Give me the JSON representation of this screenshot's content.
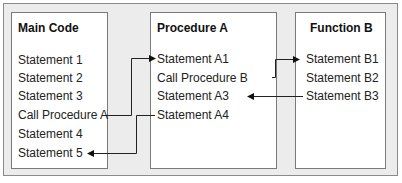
{
  "boxes": [
    {
      "title": "Main Code",
      "statements": [
        "Statement 1",
        "Statement 2",
        "Statement 3",
        "Call Procedure A",
        "Statement 4",
        "Statement 5"
      ]
    },
    {
      "title": "Procedure A",
      "statements": [
        "Statement A1",
        "Call Procedure B",
        "Statement A3",
        "Statement A4"
      ]
    },
    {
      "title": "Function B",
      "statements": [
        "Statement B1",
        "Statement B2",
        "Statement B3"
      ]
    }
  ],
  "connections": [
    {
      "from": "Call Procedure A",
      "to": "Statement A1"
    },
    {
      "from": "Call Procedure B",
      "to": "Statement B1"
    },
    {
      "from": "Statement B3",
      "to": "Statement A3"
    },
    {
      "from": "Statement A4",
      "to": "Statement 5"
    }
  ]
}
